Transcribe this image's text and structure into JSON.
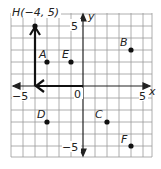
{
  "graph": {
    "axis_labels": {
      "x": "x",
      "y": "y"
    },
    "tick_labels": {
      "x_neg": "−5",
      "x_pos": "5",
      "y_pos": "5",
      "y_neg": "−5",
      "origin": "0"
    },
    "grid": {
      "x_min": -6,
      "x_max": 6,
      "y_min": -6,
      "y_max": 6
    },
    "points": [
      {
        "name": "H",
        "label": "H(−4, 5)",
        "x": -4,
        "y": 5
      },
      {
        "name": "A",
        "label": "A",
        "x": -3,
        "y": 2
      },
      {
        "name": "E",
        "label": "E",
        "x": -1,
        "y": 2
      },
      {
        "name": "B",
        "label": "B",
        "x": 4,
        "y": 3
      },
      {
        "name": "D",
        "label": "D",
        "x": -3,
        "y": -3
      },
      {
        "name": "C",
        "label": "C",
        "x": 2,
        "y": -3
      },
      {
        "name": "F",
        "label": "F",
        "x": 4,
        "y": -5
      }
    ],
    "path": [
      {
        "x": 0,
        "y": 0
      },
      {
        "x": -4,
        "y": 0
      },
      {
        "x": -4,
        "y": 5
      }
    ]
  }
}
